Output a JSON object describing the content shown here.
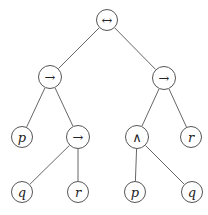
{
  "tree": {
    "nodes": [
      {
        "id": "root",
        "label": "↔",
        "kind": "op",
        "x": 107,
        "y": 20,
        "r": 11
      },
      {
        "id": "l",
        "label": "→",
        "kind": "op",
        "x": 50,
        "y": 77,
        "r": 12
      },
      {
        "id": "r",
        "label": "→",
        "kind": "op",
        "x": 164,
        "y": 78,
        "r": 12
      },
      {
        "id": "ll",
        "label": "p",
        "kind": "var",
        "x": 22,
        "y": 137,
        "r": 11
      },
      {
        "id": "lr",
        "label": "→",
        "kind": "op",
        "x": 78,
        "y": 137,
        "r": 12
      },
      {
        "id": "rl",
        "label": "∧",
        "kind": "op",
        "x": 137,
        "y": 137,
        "r": 12
      },
      {
        "id": "rr",
        "label": "r",
        "kind": "var",
        "x": 191,
        "y": 137,
        "r": 11
      },
      {
        "id": "lrl",
        "label": "q",
        "kind": "var",
        "x": 22,
        "y": 192,
        "r": 11
      },
      {
        "id": "lrr",
        "label": "r",
        "kind": "var",
        "x": 78,
        "y": 192,
        "r": 11
      },
      {
        "id": "rll",
        "label": "p",
        "kind": "var",
        "x": 135,
        "y": 192,
        "r": 11
      },
      {
        "id": "rlr",
        "label": "q",
        "kind": "var",
        "x": 192,
        "y": 192,
        "r": 11
      }
    ],
    "edges": [
      [
        "root",
        "l"
      ],
      [
        "root",
        "r"
      ],
      [
        "l",
        "ll"
      ],
      [
        "l",
        "lr"
      ],
      [
        "r",
        "rl"
      ],
      [
        "r",
        "rr"
      ],
      [
        "lr",
        "lrl"
      ],
      [
        "lr",
        "lrr"
      ],
      [
        "rl",
        "rll"
      ],
      [
        "rl",
        "rlr"
      ]
    ]
  }
}
